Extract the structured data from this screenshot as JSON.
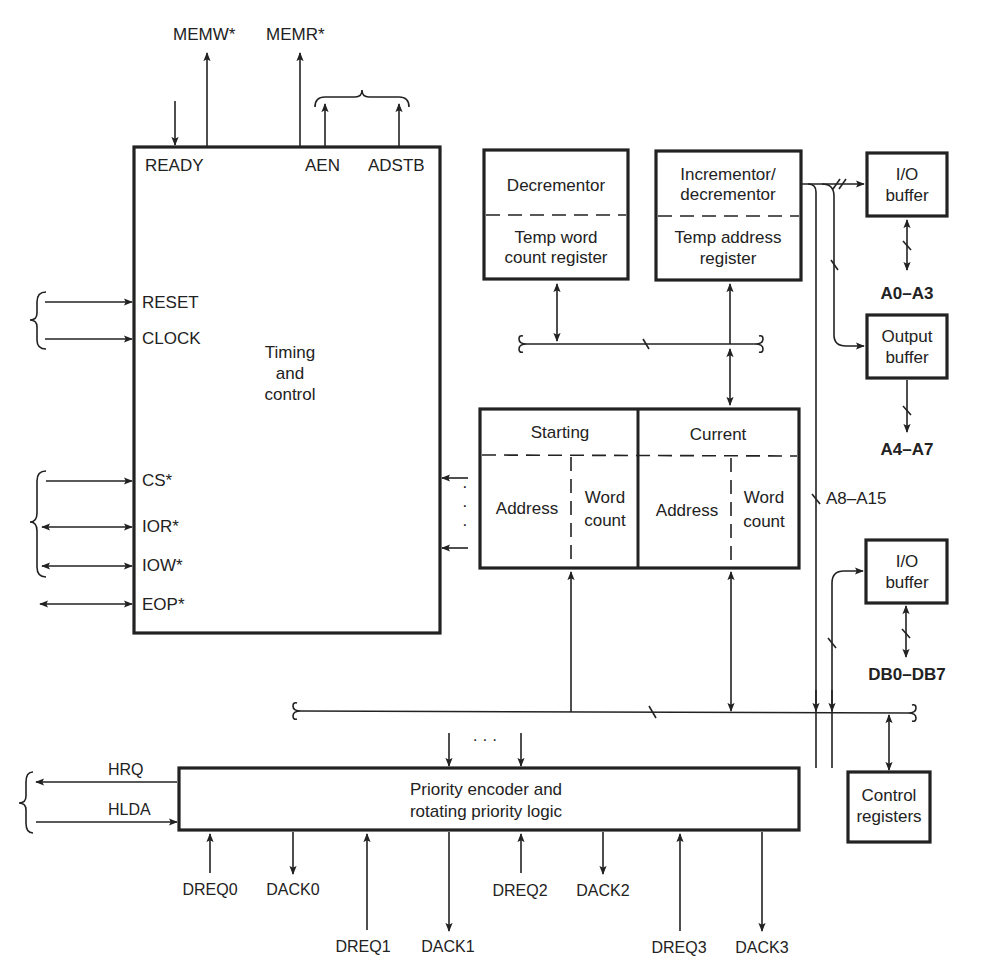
{
  "diagram": {
    "colors": {
      "ink": "#222222",
      "background": "#ffffff"
    },
    "top_signals": {
      "memw": "MEMW*",
      "memr": "MEMR*"
    },
    "timing_block": {
      "label_line1": "Timing",
      "label_line2": "and",
      "label_line3": "control",
      "pins": {
        "ready": "READY",
        "aen": "AEN",
        "adstb": "ADSTB",
        "reset": "RESET",
        "clock": "CLOCK",
        "cs": "CS*",
        "ior": "IOR*",
        "iow": "IOW*",
        "eop": "EOP*"
      }
    },
    "decrementor_block": {
      "top": "Decrementor",
      "bottom_line1": "Temp word",
      "bottom_line2": "count register"
    },
    "incrementor_block": {
      "top_line1": "Incrementor/",
      "top_line2": "decrementor",
      "bottom_line1": "Temp address",
      "bottom_line2": "register"
    },
    "register_file": {
      "starting": "Starting",
      "current": "Current",
      "address": "Address",
      "word_line1": "Word",
      "word_line2": "count"
    },
    "io_buffer_addr": {
      "line1": "I/O",
      "line2": "buffer",
      "bus": "A0–A3"
    },
    "output_buffer": {
      "line1": "Output",
      "line2": "buffer",
      "bus": "A4–A7"
    },
    "addr_high": "A8–A15",
    "io_buffer_data": {
      "line1": "I/O",
      "line2": "buffer",
      "bus": "DB0–DB7"
    },
    "control_registers": {
      "line1": "Control",
      "line2": "registers"
    },
    "priority_block": {
      "line1": "Priority encoder and",
      "line2": "rotating priority logic",
      "hrq": "HRQ",
      "hlda": "HLDA",
      "channels": [
        {
          "dreq": "DREQ0",
          "dack": "DACK0"
        },
        {
          "dreq": "DREQ1",
          "dack": "DACK1"
        },
        {
          "dreq": "DREQ2",
          "dack": "DACK2"
        },
        {
          "dreq": "DREQ3",
          "dack": "DACK3"
        }
      ]
    },
    "ellipsis_v": "· · ·",
    "ellipsis_h": "· · ·"
  }
}
